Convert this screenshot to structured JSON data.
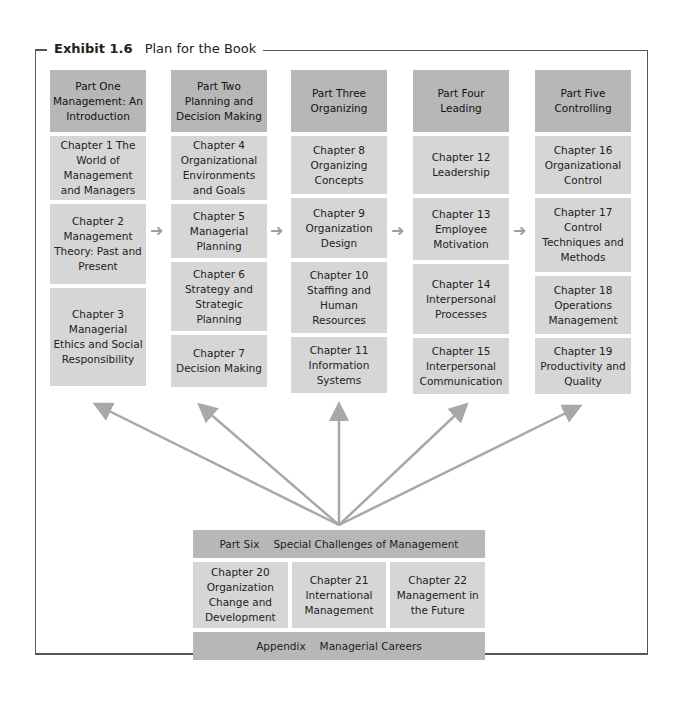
{
  "exhibit": {
    "label": "Exhibit 1.6",
    "title": "Plan for the Book"
  },
  "columns": [
    {
      "part": "Part One Management: An Introduction",
      "chapters": [
        "Chapter 1 The World of Management and Managers",
        "Chapter 2 Management Theory: Past and Present",
        "Chapter 3 Managerial Ethics and Social Responsibility"
      ]
    },
    {
      "part": "Part Two Planning and Decision Making",
      "chapters": [
        "Chapter 4 Organizational Environments and Goals",
        "Chapter 5 Managerial Planning",
        "Chapter 6 Strategy and Strategic Planning",
        "Chapter 7 Decision Making"
      ]
    },
    {
      "part": "Part Three Organizing",
      "chapters": [
        "Chapter 8 Organizing Concepts",
        "Chapter 9 Organization Design",
        "Chapter 10 Staffing and Human Resources",
        "Chapter 11 Information Systems"
      ]
    },
    {
      "part": "Part Four Leading",
      "chapters": [
        "Chapter 12 Leadership",
        "Chapter 13 Employee Motivation",
        "Chapter 14 Interpersonal Processes",
        "Chapter 15 Interpersonal Communication"
      ]
    },
    {
      "part": "Part Five Controlling",
      "chapters": [
        "Chapter 16 Organizational Control",
        "Chapter 17 Control Techniques and Methods",
        "Chapter 18 Operations Management",
        "Chapter 19 Productivity and Quality"
      ]
    }
  ],
  "part_six": {
    "label": "Part Six",
    "title": "Special Challenges of Management",
    "chapters": [
      "Chapter 20 Organization Change and Development",
      "Chapter 21 International Management",
      "Chapter 22 Management in the Future"
    ]
  },
  "appendix": {
    "label": "Appendix",
    "title": "Managerial Careers"
  },
  "colors": {
    "part_fill": "#b7b7b7",
    "chapter_fill": "#d6d6d6",
    "arrow": "#a8a8a8"
  }
}
